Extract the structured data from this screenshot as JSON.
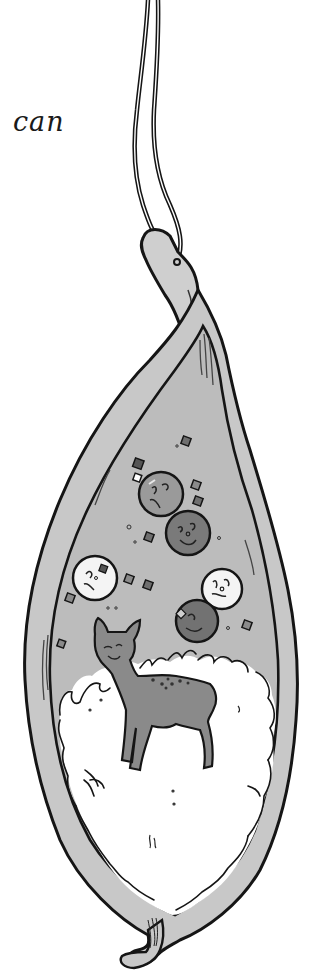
{
  "page": {
    "caption_text": "can"
  },
  "illustration": {
    "subject": "seed-pod-with-deer",
    "elements": {
      "strings": 2,
      "face_circles": [
        {
          "id": "circle-1",
          "shade": "medium",
          "expression": "frown"
        },
        {
          "id": "circle-2",
          "shade": "dark",
          "expression": "smile"
        },
        {
          "id": "circle-3",
          "shade": "light",
          "expression": "frown"
        },
        {
          "id": "circle-4",
          "shade": "light",
          "expression": "frown"
        },
        {
          "id": "circle-5",
          "shade": "dark",
          "expression": "smile"
        }
      ],
      "deer": {
        "shade": "dark-gray",
        "spots": true
      }
    },
    "colors": {
      "outline": "#151515",
      "pod_fill": "#c8c8c8",
      "pod_inner": "#b9b9b9",
      "fluff": "#ffffff",
      "circle_light": "#f4f4f4",
      "circle_medium": "#9a9a9a",
      "circle_dark": "#7a7a7a",
      "deer": "#8a8a8a",
      "square_dark": "#6e6e6e"
    }
  }
}
